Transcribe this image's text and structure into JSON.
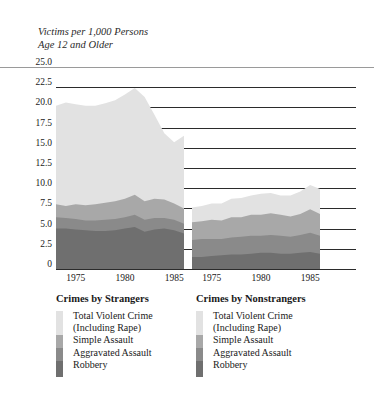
{
  "axis_title": "Victims per 1,000 Persons\nAge 12 and Older",
  "colors": {
    "total_violent_crime": "#e2e2e2",
    "simple_assault": "#a8a8a8",
    "aggravated_assault": "#8a8a8a",
    "robbery": "#6f6f6f",
    "gridline": "#2b2b2b",
    "top_rule": "#9a9a9a",
    "text": "#1a1a1a"
  },
  "legends": [
    {
      "title": "Crimes by Strangers",
      "entries": [
        "Total Violent Crime\n(Including Rape)",
        "Simple Assault",
        "Aggravated Assault",
        "Robbery"
      ]
    },
    {
      "title": "Crimes by Nonstrangers",
      "entries": [
        "Total Violent Crime\n(Including Rape)",
        "Simple Assault",
        "Aggravated Assault",
        "Robbery"
      ]
    }
  ],
  "chart_data": {
    "type": "area",
    "title": "",
    "subtitle": "",
    "xlabel": "",
    "ylabel": "Victims per 1,000 Persons Age 12 and Older",
    "ylim": [
      0,
      25.0
    ],
    "yticks": [
      "0",
      "2.5",
      "5.0",
      "7.5",
      "10.0",
      "12.5",
      "15.0",
      "17.5",
      "20.0",
      "22.5",
      "25.0"
    ],
    "ytick_values": [
      0,
      2.5,
      5.0,
      7.5,
      10.0,
      12.5,
      15.0,
      17.5,
      20.0,
      22.5,
      25.0
    ],
    "grid": true,
    "legend_position": "below",
    "stacked": true,
    "stack_order_bottom_to_top": [
      "Robbery",
      "Aggravated Assault",
      "Simple Assault",
      "Total Violent Crime (Including Rape)"
    ],
    "panels": [
      {
        "name": "Crimes by Strangers",
        "xlim": [
          1973,
          1986
        ],
        "xticks": [
          1975,
          1980,
          1985
        ],
        "xtick_labels": [
          "1975",
          "1980",
          "1985"
        ],
        "x": [
          1973,
          1974,
          1975,
          1976,
          1977,
          1978,
          1979,
          1980,
          1981,
          1982,
          1983,
          1984,
          1985,
          1986
        ],
        "series": [
          {
            "name": "Robbery",
            "values": [
              5.0,
              5.0,
              4.9,
              4.8,
              4.7,
              4.7,
              4.8,
              5.0,
              5.2,
              4.6,
              4.9,
              5.0,
              4.8,
              4.4
            ]
          },
          {
            "name": "Aggravated Assault",
            "values": [
              1.4,
              1.3,
              1.3,
              1.2,
              1.3,
              1.4,
              1.4,
              1.4,
              1.5,
              1.5,
              1.4,
              1.3,
              1.3,
              1.2
            ]
          },
          {
            "name": "Simple Assault",
            "values": [
              1.6,
              1.5,
              1.8,
              1.9,
              2.0,
              2.1,
              2.2,
              2.3,
              2.5,
              2.3,
              2.4,
              2.3,
              2.0,
              1.9
            ]
          },
          {
            "name": "Total Violent Crime (Including Rape)",
            "values": [
              12.2,
              12.8,
              12.4,
              12.3,
              12.2,
              12.3,
              12.5,
              12.9,
              13.2,
              12.9,
              10.4,
              8.2,
              7.6,
              9.0
            ]
          }
        ],
        "stack_totals": [
          20.2,
          20.6,
          20.4,
          20.2,
          20.2,
          20.5,
          20.9,
          21.6,
          22.4,
          21.3,
          19.1,
          16.8,
          15.7,
          16.5
        ]
      },
      {
        "name": "Crimes by Nonstrangers",
        "xlim": [
          1973,
          1986
        ],
        "xticks": [
          1975,
          1980,
          1985
        ],
        "xtick_labels": [
          "1975",
          "1980",
          "1985"
        ],
        "x": [
          1973,
          1974,
          1975,
          1976,
          1977,
          1978,
          1979,
          1980,
          1981,
          1982,
          1983,
          1984,
          1985,
          1986
        ],
        "series": [
          {
            "name": "Robbery",
            "values": [
              1.5,
              1.5,
              1.6,
              1.7,
              1.8,
              1.8,
              1.9,
              2.0,
              2.0,
              1.9,
              1.9,
              2.0,
              2.1,
              1.9
            ]
          },
          {
            "name": "Aggravated Assault",
            "values": [
              2.1,
              2.2,
              2.1,
              2.0,
              2.1,
              2.2,
              2.2,
              2.1,
              2.2,
              2.2,
              2.1,
              2.2,
              2.4,
              2.2
            ]
          },
          {
            "name": "Simple Assault",
            "values": [
              2.2,
              2.2,
              2.4,
              2.3,
              2.5,
              2.4,
              2.6,
              2.6,
              2.7,
              2.6,
              2.5,
              2.6,
              2.9,
              2.7
            ]
          },
          {
            "name": "Total Violent Crime (Including Rape)",
            "values": [
              1.8,
              1.9,
              2.0,
              2.1,
              2.3,
              2.4,
              2.4,
              2.6,
              2.5,
              2.4,
              2.6,
              2.8,
              3.0,
              3.1
            ]
          }
        ],
        "stack_totals": [
          7.6,
          7.8,
          8.1,
          8.1,
          8.7,
          8.8,
          9.1,
          9.3,
          9.4,
          9.1,
          9.1,
          9.6,
          10.4,
          9.9
        ]
      }
    ]
  }
}
